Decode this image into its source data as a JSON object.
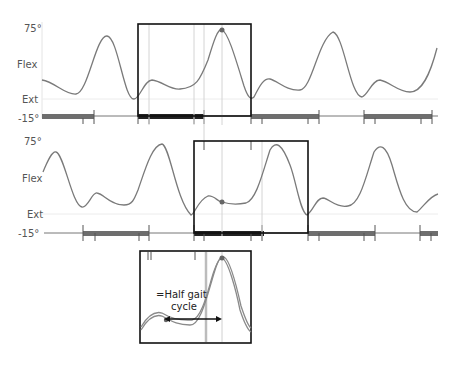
{
  "panels": [
    {
      "id": "top",
      "axis": {
        "top_label": "75°",
        "mid_label": "Flex",
        "ext_label": "Ext",
        "bottom_label": "-15°"
      }
    },
    {
      "id": "middle",
      "axis": {
        "top_label": "75°",
        "mid_label": "Flex",
        "ext_label": "Ext",
        "bottom_label": "-15°"
      }
    }
  ],
  "inset": {
    "annotation_line1": "=Half gait",
    "annotation_line2": "cycle"
  },
  "colors": {
    "curve": "#7a7a7a",
    "box": "#111111",
    "stance_bar": "#6e6e6e",
    "guide": "#cfcfcf",
    "marker": "#666666"
  }
}
